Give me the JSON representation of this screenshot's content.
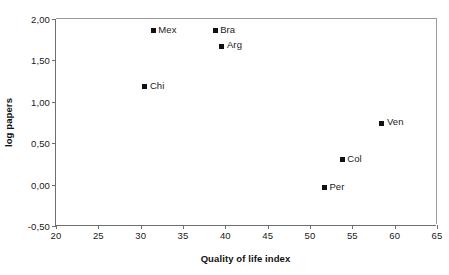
{
  "chart_data": {
    "type": "scatter",
    "title": "",
    "xlabel": "Quality of life index",
    "ylabel": "log papers",
    "xlim": [
      20,
      65
    ],
    "ylim": [
      -0.5,
      2.0
    ],
    "xticks": [
      20,
      25,
      30,
      35,
      40,
      45,
      50,
      55,
      60,
      65
    ],
    "xticklabels": [
      "20",
      "25",
      "30",
      "35",
      "40",
      "45",
      "50",
      "55",
      "60",
      "65"
    ],
    "yticks": [
      -0.5,
      0.0,
      0.5,
      1.0,
      1.5,
      2.0
    ],
    "yticklabels": [
      "-0,50",
      "0,00",
      "0,50",
      "1,00",
      "1,50",
      "2,00"
    ],
    "grid": false,
    "legend": false,
    "decimal_separator": ",",
    "marker_style": "filled-square",
    "marker_color": "#111111",
    "points": [
      {
        "label": "Mex",
        "x": 31.5,
        "y": 1.86
      },
      {
        "label": "Bra",
        "x": 38.8,
        "y": 1.86
      },
      {
        "label": "Arg",
        "x": 39.6,
        "y": 1.67
      },
      {
        "label": "Chi",
        "x": 30.5,
        "y": 1.18
      },
      {
        "label": "Ven",
        "x": 58.5,
        "y": 0.74
      },
      {
        "label": "Col",
        "x": 53.8,
        "y": 0.3
      },
      {
        "label": "Per",
        "x": 51.7,
        "y": -0.04
      }
    ]
  }
}
